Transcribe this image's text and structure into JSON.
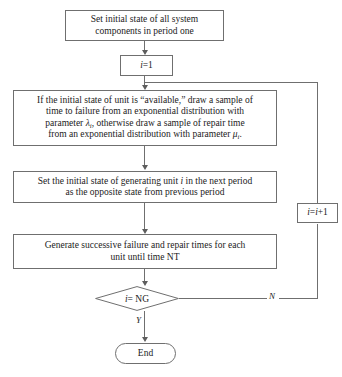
{
  "figure": {
    "type": "flowchart",
    "orientation": "top-to-bottom",
    "caption": ""
  },
  "nodes": {
    "start": {
      "shape": "process",
      "line1": "Set initial state of all system",
      "line2": "components in period one"
    },
    "init_i": {
      "shape": "process",
      "label_prefix": "i",
      "label_rest": "=1"
    },
    "sample": {
      "shape": "process",
      "line1_a": "If the initial state of unit is “available,” draw a sample of",
      "line2_a": "time to failure from an exponential distribution with",
      "line3_a": "parameter ",
      "line3_sym": "λ",
      "line3_sub": "i",
      "line3_b": ", otherwise draw a sample of repair time",
      "line4_a": "from an exponential distribution with parameter ",
      "line4_sym": "μ",
      "line4_sub": "i",
      "line4_b": "."
    },
    "set_state": {
      "shape": "process",
      "line1_a": "Set the initial state of generating unit ",
      "line1_sym": "i",
      "line1_b": " in the next period",
      "line2": "as the opposite state from previous period"
    },
    "generate": {
      "shape": "process",
      "line1": "Generate successive failure and repair times for each",
      "line2": "unit until time NT"
    },
    "decision": {
      "shape": "diamond",
      "label_sym": "i",
      "label_rest": " = NG"
    },
    "increment": {
      "shape": "process",
      "label_sym1": "i",
      "label_eq": "=",
      "label_sym2": "i",
      "label_rest": "+1"
    },
    "end": {
      "shape": "terminator",
      "label": "End"
    }
  },
  "edge_labels": {
    "no_branch": "N",
    "yes_branch": "Y"
  },
  "colors": {
    "stroke": "#6f6f6f",
    "text": "#222222",
    "background": "#ffffff",
    "arrow": "#5d5d5d"
  }
}
